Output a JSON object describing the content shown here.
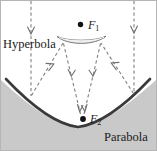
{
  "figure": {
    "type": "optics-ray-diagram",
    "labels": {
      "hyperbola": "Hyperbola",
      "parabola": "Parabola",
      "focus_1": "F",
      "focus_1_sub": "1",
      "focus_2": "F",
      "focus_2_sub": "2"
    },
    "colors": {
      "background": "#ffffff",
      "parabola_fill": "#c9c9c9",
      "parabola_stroke": "#3a3a3a",
      "hyperbola_fill": "#eeeeee",
      "hyperbola_stroke": "#5a5a5a",
      "ray_stroke": "#7a7a7a",
      "focus_dot": "#111111",
      "border": "#b5b5b5",
      "text": "#1a1a1a"
    },
    "elements": {
      "focus_1_point": {
        "x": 82,
        "y": 24
      },
      "focus_2_point": {
        "x": 82,
        "y": 119
      },
      "hyperbola_mirror": {
        "left_x": 57,
        "right_x": 106,
        "y": 38
      },
      "parabola_vertex": {
        "x": 78,
        "y": 128
      }
    },
    "rays": {
      "incoming_left_x": 31,
      "incoming_right_x": 134,
      "incoming_top_y": 0,
      "count_incoming": 2,
      "count_reflected_to_secondary": 2,
      "count_reflected_to_focus": 2
    }
  }
}
